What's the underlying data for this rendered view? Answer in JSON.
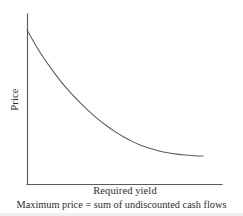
{
  "figure": {
    "name": "price-vs-required-yield-curve",
    "background_color": "#ffffff",
    "line_color": "#5a5a5a",
    "text_color": "#2b2b2b"
  },
  "labels": {
    "y_axis": "Price",
    "x_axis": "Required yield",
    "caption": "Maximum price = sum of undiscounted cash flows"
  },
  "chart_data": {
    "type": "line",
    "title": "",
    "subtitle": "",
    "xlabel": "Required yield",
    "ylabel": "Price",
    "caption": "Maximum price = sum of undiscounted cash flows",
    "grid": false,
    "legend": false,
    "legend_position": "none",
    "axis_ticks": false,
    "xlim": [
      0,
      100
    ],
    "ylim": [
      0,
      100
    ],
    "series": [
      {
        "name": "Price",
        "x": [
          0,
          5,
          10,
          15,
          20,
          25,
          30,
          35,
          40,
          45,
          50,
          55,
          60,
          65,
          70,
          75,
          80,
          85,
          90,
          95,
          100
        ],
        "y": [
          100,
          90,
          81,
          73,
          65.5,
          59,
          53,
          47.5,
          42.5,
          38,
          34,
          30.5,
          27.5,
          25,
          23,
          21.5,
          20.3,
          19.4,
          18.8,
          18.4,
          18.2
        ]
      }
    ],
    "annotations": [
      "Price falls at a decreasing rate as required yield rises (convex relationship)",
      "Curve asymptotically approaches the sum of undiscounted cash flows is the maximum price"
    ]
  },
  "geometry": {
    "y_axis_top_y": 14,
    "origin_x": 27,
    "origin_y": 184,
    "x_axis_right_x": 222,
    "curve_start": [
      27,
      30
    ],
    "curve_end": [
      203,
      156
    ]
  }
}
